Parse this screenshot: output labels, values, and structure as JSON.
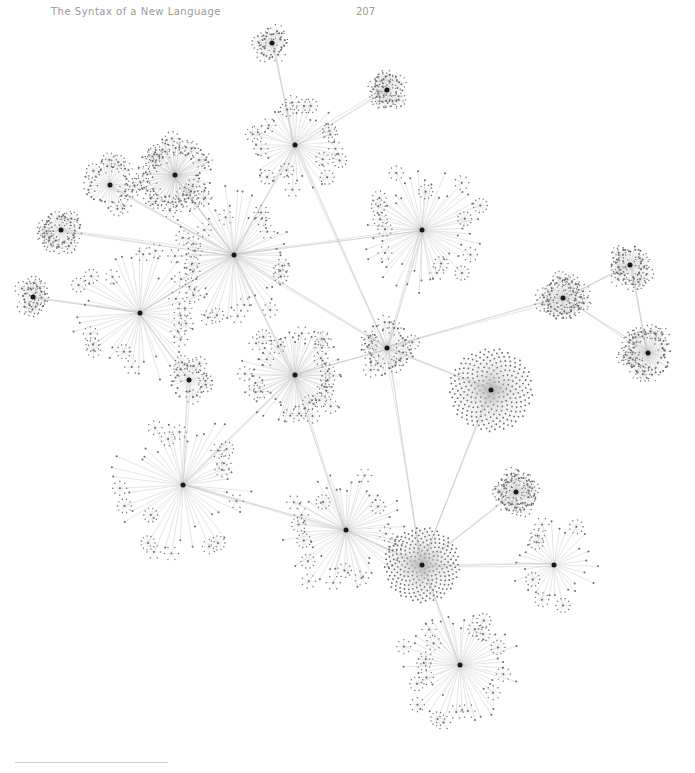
{
  "header": {
    "running_title": "The Syntax of a New Language",
    "page_number": "207"
  },
  "figure": {
    "type": "network-graph",
    "edge_color": "#bdbdbd",
    "node_color": "#6b6b6b",
    "hub_color": "#1a1a1a",
    "hubs": [
      {
        "id": "h1",
        "x": 234,
        "y": 255,
        "r": 70,
        "n": 60
      },
      {
        "id": "h2",
        "x": 175,
        "y": 175,
        "r": 38,
        "n": 80
      },
      {
        "id": "h3",
        "x": 295,
        "y": 145,
        "r": 48,
        "n": 40
      },
      {
        "id": "h4",
        "x": 140,
        "y": 313,
        "r": 70,
        "n": 45
      },
      {
        "id": "h5",
        "x": 295,
        "y": 375,
        "r": 55,
        "n": 70
      },
      {
        "id": "h6",
        "x": 422,
        "y": 230,
        "r": 65,
        "n": 55
      },
      {
        "id": "h7",
        "x": 183,
        "y": 485,
        "r": 75,
        "n": 45
      },
      {
        "id": "h8",
        "x": 346,
        "y": 530,
        "r": 65,
        "n": 55
      },
      {
        "id": "h9",
        "x": 422,
        "y": 565,
        "r": 38,
        "n": 260
      },
      {
        "id": "h10",
        "x": 491,
        "y": 390,
        "r": 42,
        "n": 260
      },
      {
        "id": "h11",
        "x": 460,
        "y": 665,
        "r": 60,
        "n": 50
      },
      {
        "id": "h12",
        "x": 554,
        "y": 565,
        "r": 45,
        "n": 30
      },
      {
        "id": "h13",
        "x": 563,
        "y": 298,
        "r": 22,
        "n": 50
      },
      {
        "id": "h14",
        "x": 630,
        "y": 265,
        "r": 20,
        "n": 40
      },
      {
        "id": "h15",
        "x": 648,
        "y": 353,
        "r": 25,
        "n": 60
      },
      {
        "id": "h16",
        "x": 516,
        "y": 492,
        "r": 22,
        "n": 50
      },
      {
        "id": "h17",
        "x": 387,
        "y": 348,
        "r": 28,
        "n": 40
      },
      {
        "id": "h18",
        "x": 110,
        "y": 185,
        "r": 28,
        "n": 35
      },
      {
        "id": "h19",
        "x": 61,
        "y": 230,
        "r": 20,
        "n": 35
      },
      {
        "id": "h20",
        "x": 272,
        "y": 43,
        "r": 15,
        "n": 30
      },
      {
        "id": "h21",
        "x": 387,
        "y": 90,
        "r": 16,
        "n": 30
      },
      {
        "id": "h22",
        "x": 189,
        "y": 380,
        "r": 20,
        "n": 25
      },
      {
        "id": "h23",
        "x": 33,
        "y": 297,
        "r": 14,
        "n": 20
      }
    ],
    "links": [
      [
        "h1",
        "h2"
      ],
      [
        "h1",
        "h3"
      ],
      [
        "h1",
        "h4"
      ],
      [
        "h1",
        "h5"
      ],
      [
        "h1",
        "h6"
      ],
      [
        "h1",
        "h17"
      ],
      [
        "h1",
        "h19"
      ],
      [
        "h1",
        "h18"
      ],
      [
        "h3",
        "h20"
      ],
      [
        "h3",
        "h21"
      ],
      [
        "h3",
        "h17"
      ],
      [
        "h5",
        "h7"
      ],
      [
        "h5",
        "h8"
      ],
      [
        "h5",
        "h17"
      ],
      [
        "h4",
        "h22"
      ],
      [
        "h4",
        "h23"
      ],
      [
        "h17",
        "h13"
      ],
      [
        "h13",
        "h14"
      ],
      [
        "h14",
        "h15"
      ],
      [
        "h13",
        "h15"
      ],
      [
        "h17",
        "h10"
      ],
      [
        "h17",
        "h9"
      ],
      [
        "h8",
        "h9"
      ],
      [
        "h9",
        "h11"
      ],
      [
        "h9",
        "h12"
      ],
      [
        "h9",
        "h16"
      ],
      [
        "h10",
        "h9"
      ],
      [
        "h7",
        "h22"
      ],
      [
        "h6",
        "h17"
      ],
      [
        "h7",
        "h8"
      ]
    ]
  },
  "footnote": {
    "rule": true
  }
}
